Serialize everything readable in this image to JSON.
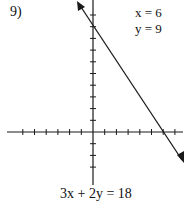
{
  "problem": {
    "number": "9)",
    "equation": "3x + 2y = 18",
    "solution": {
      "x_line": "x = 6",
      "y_line": "y = 9"
    }
  },
  "graph": {
    "type": "coordinate-plane-line",
    "line": {
      "slope": -1.5,
      "y_intercept": 9,
      "x_intercept": 6
    },
    "x_ticks_left": 6,
    "x_ticks_right": 7,
    "y_ticks_up": 10,
    "y_ticks_down": 3,
    "axis_color": "#1a1a1a",
    "line_color": "#1a1a1a"
  }
}
